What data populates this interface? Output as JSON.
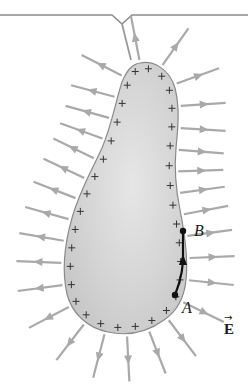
{
  "figure": {
    "colors": {
      "background": "#ffffff",
      "conductor_fill": "#d6d6d6",
      "conductor_edge": "#8a8a8a",
      "field_line": "#a9a9a9",
      "charge_mark": "#333333",
      "path": "#111111",
      "bracket": "#8c8c8c"
    },
    "labels": {
      "point_a": "A",
      "point_b": "B",
      "field_symbol": "E",
      "field_arrow": "→"
    },
    "charge_symbol": "+"
  }
}
